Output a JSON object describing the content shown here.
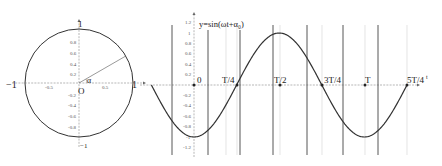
{
  "unit_circle": {
    "labels": {
      "left": "−1",
      "right": "1",
      "top": "1",
      "bottom": "−1",
      "origin": "O",
      "angle": "α"
    },
    "x_ticks": [
      "-0.5",
      "0.5"
    ],
    "y_ticks": [
      "0.8",
      "0.6",
      "0.4",
      "0.2",
      "-0.2",
      "-0.4",
      "-0.6",
      "-0.8"
    ],
    "radius_angle_deg": 30
  },
  "sine_graph": {
    "title": "y=sin(ωt+α₀)",
    "x_labels": [
      "0",
      "T/4",
      "T/2",
      "3T/4",
      "T",
      "5T/4"
    ],
    "y_ticks": [
      "1.2",
      "1",
      "0.8",
      "0.6",
      "0.4",
      "0.2",
      "-0.2",
      "-0.4",
      "-0.6",
      "-0.8",
      "-1",
      "-1.2"
    ],
    "axis_end_label": "t",
    "curve": "y = -cos(2πt/T), t from -T/4 to 5T/4",
    "colors": {
      "curve": "#333333",
      "vertical_lines": "#444444",
      "grid": "#d8d8d8",
      "axis": "#666666"
    }
  }
}
